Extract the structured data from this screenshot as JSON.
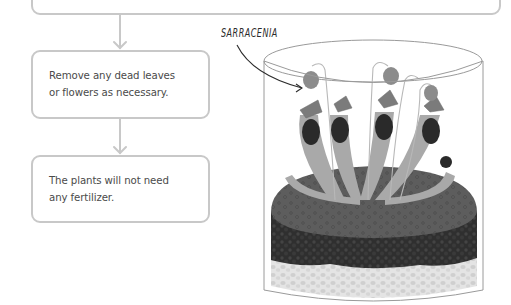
{
  "flowchart": {
    "steps": [
      {
        "id": "top-step",
        "text": ""
      },
      {
        "id": "remove-dead",
        "text": "Remove any dead leaves\nor flowers as necessary."
      },
      {
        "id": "no-fertilizer",
        "text": "The plants will not need\nany fertilizer."
      }
    ],
    "arrows": [
      {
        "from": "top-step",
        "to": "remove-dead"
      },
      {
        "from": "remove-dead",
        "to": "no-fertilizer"
      }
    ]
  },
  "illustration": {
    "subject": "terrarium-jar",
    "callout_label": "SARRACENIA",
    "layers": [
      "moss",
      "dark-soil",
      "pebbles"
    ],
    "colors": {
      "outline": "#c8c8c8",
      "text": "#4a4a4a",
      "moss": "#5e5e5e",
      "soil": "#2e2e2e",
      "pebbles": "#d2d2d2",
      "pitcher_tube": "#a8a8a8",
      "pitcher_mouth": "#2a2a2a",
      "pitcher_lid": "#7a7a7a",
      "flower": "#8c8c8c"
    }
  }
}
